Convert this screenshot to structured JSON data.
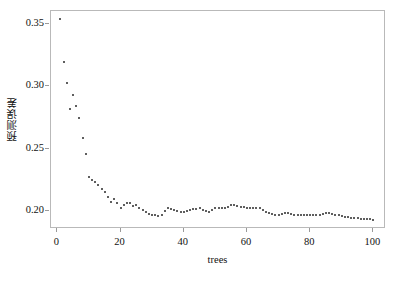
{
  "chart_data": {
    "type": "scatter",
    "title": "",
    "xlabel": "trees",
    "ylabel": "预测误差",
    "xlim": [
      -2,
      104
    ],
    "ylim": [
      0.1855,
      0.3605
    ],
    "grid": false,
    "legend": "none",
    "marker": "small-filled-circle",
    "marker_color": "#2a2a2a",
    "xticks": [
      0,
      20,
      40,
      60,
      80,
      100
    ],
    "xtick_labels": [
      "0",
      "20",
      "40",
      "60",
      "80",
      "100"
    ],
    "yticks": [
      0.2,
      0.25,
      0.3,
      0.35
    ],
    "ytick_labels": [
      "0.20",
      "0.25",
      "0.30",
      "0.35"
    ],
    "x": [
      1,
      2,
      3,
      4,
      5,
      6,
      7,
      8,
      9,
      10,
      11,
      12,
      13,
      14,
      15,
      16,
      17,
      18,
      19,
      20,
      21,
      22,
      23,
      24,
      25,
      26,
      27,
      28,
      29,
      30,
      31,
      32,
      33,
      34,
      35,
      36,
      37,
      38,
      39,
      40,
      41,
      42,
      43,
      44,
      45,
      46,
      47,
      48,
      49,
      50,
      51,
      52,
      53,
      54,
      55,
      56,
      57,
      58,
      59,
      60,
      61,
      62,
      63,
      64,
      65,
      66,
      67,
      68,
      69,
      70,
      71,
      72,
      73,
      74,
      75,
      76,
      77,
      78,
      79,
      80,
      81,
      82,
      83,
      84,
      85,
      86,
      87,
      88,
      89,
      90,
      91,
      92,
      93,
      94,
      95,
      96,
      97,
      98,
      99,
      100
    ],
    "y": [
      0.354,
      0.3195,
      0.3025,
      0.282,
      0.293,
      0.2845,
      0.2745,
      0.2585,
      0.246,
      0.227,
      0.225,
      0.223,
      0.2205,
      0.218,
      0.215,
      0.211,
      0.2075,
      0.2095,
      0.206,
      0.202,
      0.2045,
      0.2065,
      0.206,
      0.204,
      0.205,
      0.202,
      0.2005,
      0.199,
      0.1975,
      0.1965,
      0.1965,
      0.196,
      0.197,
      0.2,
      0.202,
      0.2015,
      0.2005,
      0.2,
      0.1995,
      0.1995,
      0.2,
      0.2005,
      0.2015,
      0.2015,
      0.202,
      0.201,
      0.2,
      0.1995,
      0.2005,
      0.202,
      0.202,
      0.202,
      0.2025,
      0.2035,
      0.2045,
      0.2045,
      0.204,
      0.2035,
      0.203,
      0.2025,
      0.202,
      0.202,
      0.2025,
      0.202,
      0.2005,
      0.1995,
      0.1985,
      0.1975,
      0.1965,
      0.1965,
      0.1975,
      0.198,
      0.198,
      0.1975,
      0.197,
      0.197,
      0.1965,
      0.1965,
      0.197,
      0.197,
      0.1965,
      0.1965,
      0.197,
      0.1975,
      0.198,
      0.198,
      0.1975,
      0.197,
      0.1965,
      0.196,
      0.1955,
      0.195,
      0.1945,
      0.194,
      0.194,
      0.1938,
      0.1938,
      0.1935,
      0.1933,
      0.193
    ]
  }
}
